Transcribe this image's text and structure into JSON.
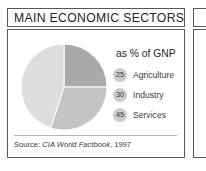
{
  "panel": {
    "title": "MAIN ECONOMIC SECTORS",
    "source_prefix": "Source: ",
    "source_title": "CIA World Factbook",
    "source_suffix": ", 1997"
  },
  "legend": {
    "heading": "as % of GNP"
  },
  "chart_data": {
    "type": "pie",
    "title": "MAIN ECONOMIC SECTORS",
    "subtitle": "as % of GNP",
    "unit": "% of GNP",
    "source": "Source: CIA World Factbook, 1997",
    "legend_position": "right",
    "grid": false,
    "categories": [
      "Agriculture",
      "Industry",
      "Services"
    ],
    "values": [
      25,
      30,
      45
    ],
    "colors": [
      "#a8a9ab",
      "#c3c4c5",
      "#dcdddd"
    ],
    "slices": [
      {
        "label": "Agriculture",
        "value": 25,
        "color": "#a8a9ab",
        "start_angle": 0,
        "end_angle": 90
      },
      {
        "label": "Industry",
        "value": 30,
        "color": "#c3c4c5",
        "start_angle": 90,
        "end_angle": 198
      },
      {
        "label": "Services",
        "value": 45,
        "color": "#dcdddd",
        "start_angle": 198,
        "end_angle": 360
      }
    ]
  }
}
